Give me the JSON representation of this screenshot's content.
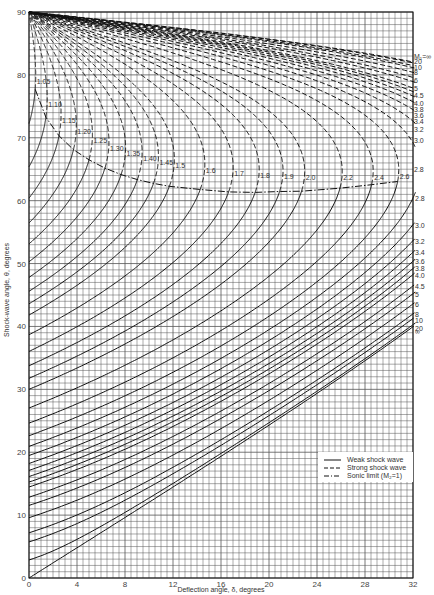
{
  "chart_data": {
    "type": "line",
    "title": "",
    "xlabel": "Deflection angle, δ, degrees",
    "ylabel": "Shock-wave angle, θ, degrees",
    "xlim": [
      0,
      32
    ],
    "ylim": [
      0,
      90
    ],
    "x_ticks": [
      "0",
      "4",
      "8",
      "12",
      "16",
      "20",
      "24",
      "28",
      "32"
    ],
    "y_ticks": [
      "0",
      "10",
      "20",
      "30",
      "40",
      "50",
      "60",
      "70",
      "80",
      "90"
    ],
    "grid": {
      "x_minor_step": 0.5,
      "y_minor_step": 1,
      "on": true
    },
    "gamma": 1.4,
    "mach_numbers_low": [
      1.05,
      1.1,
      1.15,
      1.2,
      1.25,
      1.3,
      1.35,
      1.4,
      1.45,
      1.5,
      1.6,
      1.7,
      1.8,
      1.9,
      2.0,
      2.2,
      2.4,
      2.6
    ],
    "mach_numbers_high": [
      2.8,
      3.0,
      3.2,
      3.4,
      3.6,
      3.8,
      4.0,
      4.5,
      5,
      6,
      8,
      10,
      20,
      "∞"
    ],
    "low_labels": [
      "1.05",
      "1.10",
      "1.15",
      "1.20",
      "1.25",
      "1.30",
      "1.35",
      "1.40",
      "1.45",
      "1.5",
      "1.6",
      "1.7",
      "1.8",
      "1.9",
      "2.0",
      "2.2",
      "2.4",
      "2.6"
    ],
    "right_labels_strong": [
      "M₁=∞",
      "20",
      "10",
      "8",
      "6",
      "5",
      "4.5",
      "4.0",
      "3.8",
      "3.6",
      "3.4",
      "3.2",
      "3.0",
      "2.8"
    ],
    "right_labels_weak": [
      "2.8",
      "3.0",
      "3.2",
      "3.4",
      "3.6",
      "3.8",
      "4.0",
      "4.5",
      "5",
      "6",
      "8",
      "10",
      "20",
      "∞"
    ],
    "legend": {
      "position": "lower-right",
      "entries": [
        {
          "label": "Weak shock wave",
          "style": "solid"
        },
        {
          "label": "Strong shock wave",
          "style": "dashed"
        },
        {
          "label": "Sonic limit (M₂=1)",
          "style": "dash-dot"
        }
      ]
    },
    "series": [
      {
        "name": "Weak shock wave",
        "style": "solid",
        "description": "θ vs δ lower branch for each M₁, from θ=arcsin(1/M₁) at δ=0 up to sonic point"
      },
      {
        "name": "Strong shock wave",
        "style": "dashed",
        "description": "θ vs δ upper branch for each M₁, from max deflection up to θ=90° at δ=0"
      },
      {
        "name": "Sonic limit (M₂=1)",
        "style": "dash-dot",
        "description": "locus of M₂=1 across Mach numbers, from ~θ=80° at δ≈0 to ~θ=64° near δ=32"
      }
    ]
  }
}
